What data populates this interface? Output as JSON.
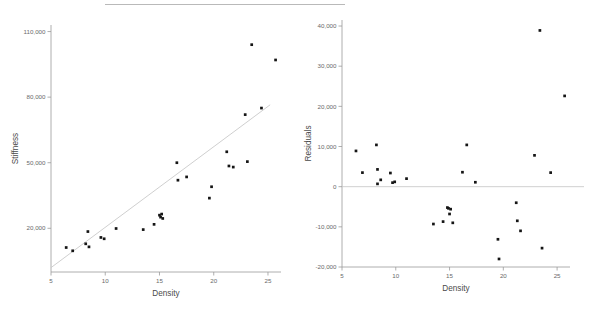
{
  "figure": {
    "background_color": "#ffffff",
    "artifact_line_color": "#b9b9b9",
    "point_color": "#151515",
    "axis_color": "#9a9a9a",
    "fit_line_color": "#c9c9c9"
  },
  "chart_data": [
    {
      "type": "scatter",
      "panel": "left",
      "title": "",
      "xlabel": "Density",
      "ylabel": "Stiffness",
      "xlim": [
        5,
        26.2
      ],
      "ylim": [
        0,
        113000
      ],
      "grid": false,
      "legend": "none",
      "xticks": [
        5,
        10,
        15,
        20,
        25
      ],
      "xtick_labels": [
        "5",
        "10",
        "15",
        "20",
        "25"
      ],
      "yticks": [
        20000,
        50000,
        80000,
        110000
      ],
      "ytick_labels": [
        "20,000",
        "50,000",
        "80,000",
        "110,000"
      ],
      "x": [
        6.4,
        7.0,
        8.2,
        8.4,
        8.5,
        9.6,
        9.9,
        11.0,
        13.5,
        14.5,
        15.0,
        15.1,
        15.2,
        15.3,
        16.6,
        16.7,
        17.5,
        19.6,
        19.8,
        21.2,
        21.4,
        21.8,
        22.9,
        23.1,
        23.5,
        24.4,
        25.7
      ],
      "y": [
        11200,
        9700,
        12900,
        18500,
        11500,
        15800,
        15200,
        19900,
        19400,
        21800,
        26000,
        25100,
        26500,
        24500,
        50000,
        42000,
        43500,
        33800,
        39000,
        55000,
        48500,
        48000,
        72000,
        50500,
        104000,
        75000,
        97000
      ],
      "series": [
        {
          "name": "Stiffness vs Density",
          "marker": "filled-square",
          "point_count": 27
        },
        {
          "name": "least-squares fit",
          "type": "line",
          "line_from": [
            5.0,
            2000
          ],
          "line_to": [
            25.2,
            76500
          ]
        }
      ]
    },
    {
      "type": "scatter",
      "panel": "right",
      "title": "",
      "xlabel": "Density",
      "ylabel": "Residuals",
      "xlim": [
        5,
        26.2
      ],
      "ylim": [
        -20000,
        41500
      ],
      "grid": false,
      "legend": "none",
      "xticks": [
        5,
        10,
        15,
        20,
        25
      ],
      "xtick_labels": [
        "5",
        "10",
        "15",
        "20",
        "25"
      ],
      "yticks": [
        -20000,
        -10000,
        0,
        10000,
        20000,
        30000,
        40000
      ],
      "ytick_labels": [
        "-20,000",
        "-10,000",
        "0",
        "10,000",
        "20,000",
        "30,000",
        "40,000"
      ],
      "reference_line_y": 0,
      "x": [
        6.3,
        6.9,
        8.2,
        8.3,
        8.3,
        8.6,
        9.5,
        9.7,
        9.9,
        11.0,
        13.5,
        14.4,
        14.8,
        14.9,
        15.0,
        15.1,
        15.3,
        16.2,
        16.6,
        17.4,
        19.5,
        19.6,
        21.2,
        21.3,
        21.6,
        22.9,
        23.4,
        23.6,
        24.4,
        25.7
      ],
      "y": [
        8900,
        3500,
        10400,
        4300,
        700,
        1700,
        3400,
        1000,
        1200,
        2000,
        -9300,
        -8700,
        -5200,
        -5400,
        -6800,
        -5600,
        -9000,
        3600,
        10400,
        1100,
        -13100,
        -18000,
        -4000,
        -8500,
        -11000,
        7800,
        38900,
        -15300,
        3500,
        22600
      ],
      "series": [
        {
          "name": "Residuals vs Density",
          "marker": "filled-square",
          "point_count": 30
        }
      ]
    }
  ]
}
